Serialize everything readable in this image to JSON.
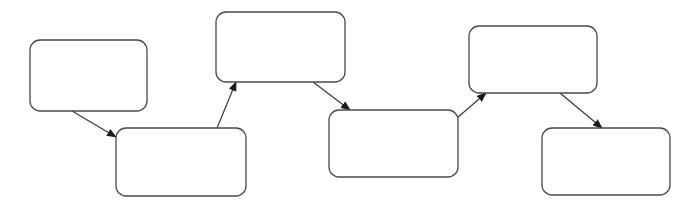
{
  "diagram": {
    "type": "flowchart",
    "canvas": {
      "width": 696,
      "height": 208,
      "background": "#ffffff"
    },
    "style": {
      "node_stroke": "#4a4a4a",
      "node_fill": "#ffffff",
      "edge_stroke": "#3a3a3a",
      "corner_radius": 10
    },
    "nodes": [
      {
        "id": "n1",
        "label": "",
        "x": 30,
        "y": 40,
        "w": 117,
        "h": 71
      },
      {
        "id": "n2",
        "label": "",
        "x": 116,
        "y": 128,
        "w": 130,
        "h": 68
      },
      {
        "id": "n3",
        "label": "",
        "x": 216,
        "y": 12,
        "w": 129,
        "h": 70
      },
      {
        "id": "n4",
        "label": "",
        "x": 329,
        "y": 110,
        "w": 129,
        "h": 67
      },
      {
        "id": "n5",
        "label": "",
        "x": 469,
        "y": 26,
        "w": 128,
        "h": 67
      },
      {
        "id": "n6",
        "label": "",
        "x": 542,
        "y": 128,
        "w": 128,
        "h": 67
      }
    ],
    "edges": [
      {
        "from": "n1",
        "to": "n2",
        "x1": 72,
        "y1": 111,
        "x2": 116,
        "y2": 137
      },
      {
        "from": "n2",
        "to": "n3",
        "x1": 217,
        "y1": 128,
        "x2": 236,
        "y2": 82
      },
      {
        "from": "n3",
        "to": "n4",
        "x1": 313,
        "y1": 82,
        "x2": 350,
        "y2": 110
      },
      {
        "from": "n4",
        "to": "n5",
        "x1": 457,
        "y1": 118,
        "x2": 486,
        "y2": 93
      },
      {
        "from": "n5",
        "to": "n6",
        "x1": 560,
        "y1": 93,
        "x2": 602,
        "y2": 128
      }
    ]
  }
}
